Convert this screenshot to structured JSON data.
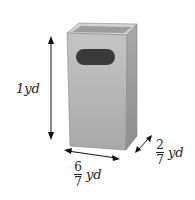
{
  "diagram": {
    "dimensions": {
      "height": {
        "label": "1yd"
      },
      "width": {
        "numerator": "6",
        "denominator": "7",
        "unit": "yd"
      },
      "depth": {
        "numerator": "2",
        "denominator": "7",
        "unit": "yd"
      }
    },
    "colors": {
      "front": "#b8b8b8",
      "side": "#9a9a9a",
      "top": "#cfcfcf",
      "opening": "#3a3a3a",
      "arrow": "#111111"
    }
  }
}
